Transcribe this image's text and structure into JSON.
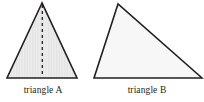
{
  "figure": {
    "background_color": "#ffffff",
    "width": 204,
    "height": 102,
    "stroke_color": "#231f20",
    "stroke_width": 1.6,
    "shapes": [
      {
        "id": "triangle-a",
        "label": "triangle A",
        "kind": "triangle",
        "description": "isosceles triangle with dashed vertical altitude",
        "fill_color": "#e9e9e9",
        "fill_pattern": "vertical-hairlines",
        "vertices": [
          [
            42,
            3
          ],
          [
            7,
            78
          ],
          [
            77,
            78
          ]
        ],
        "altitude": {
          "name": "dashed-altitude",
          "from": [
            42,
            4
          ],
          "to": [
            42,
            77
          ],
          "style": "dashed",
          "dash_pattern": "3 3",
          "color": "#231f20",
          "width": 1.3
        },
        "label_center_x": 43,
        "label_baseline_y": 94
      },
      {
        "id": "triangle-b",
        "label": "triangle B",
        "kind": "triangle",
        "description": "scalene triangle, apex left of center",
        "fill_color": "#f7f7f7",
        "fill_pattern": "solid",
        "vertices": [
          [
            118,
            4
          ],
          [
            94,
            78
          ],
          [
            202,
            78
          ]
        ],
        "altitude": null,
        "label_center_x": 146,
        "label_baseline_y": 94
      }
    ]
  }
}
